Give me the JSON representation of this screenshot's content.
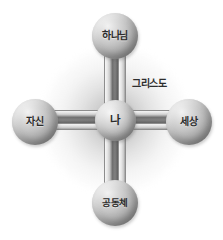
{
  "diagram": {
    "type": "cross-relationship-diagram",
    "background_color": "#ffffff",
    "node_color": "#b4b4b4",
    "connector_color": "#5a5a5a",
    "text_color": "#2b2b2b",
    "halo_color": "#8c8c8c"
  },
  "nodes": {
    "center": {
      "id": "me",
      "label": "나",
      "position": "center"
    },
    "top": {
      "id": "god",
      "label": "하나님",
      "position": "top"
    },
    "left": {
      "id": "self",
      "label": "자신",
      "position": "left"
    },
    "right": {
      "id": "world",
      "label": "세상",
      "position": "right"
    },
    "bottom": {
      "id": "community",
      "label": "공동체",
      "position": "bottom"
    }
  },
  "annotations": {
    "christ": {
      "label": "그리스도",
      "position": "upper-right"
    }
  },
  "connectors": [
    {
      "from": "me",
      "to": "god",
      "orientation": "vertical"
    },
    {
      "from": "me",
      "to": "community",
      "orientation": "vertical"
    },
    {
      "from": "me",
      "to": "self",
      "orientation": "horizontal"
    },
    {
      "from": "me",
      "to": "world",
      "orientation": "horizontal"
    }
  ]
}
